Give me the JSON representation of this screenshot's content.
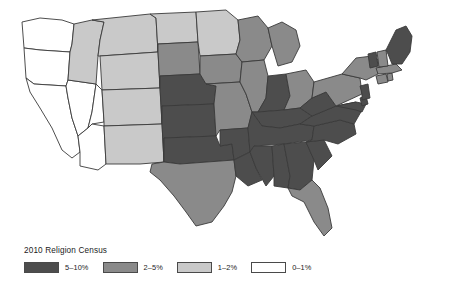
{
  "legend": {
    "title": "2010 Religion Census",
    "items": [
      {
        "label": "5–10%",
        "color": "#4d4d4d"
      },
      {
        "label": "2–5%",
        "color": "#8a8a8a"
      },
      {
        "label": "1–2%",
        "color": "#c9c9c9"
      },
      {
        "label": "0–1%",
        "color": "#ffffff"
      }
    ]
  },
  "chart_data": {
    "type": "map",
    "title": "2010 Religion Census",
    "map_region": "United States",
    "projection": "albers-usa",
    "value_unit": "percent of population",
    "classes": [
      {
        "label": "5–10%",
        "color": "#4d4d4d",
        "min": 5,
        "max": 10
      },
      {
        "label": "2–5%",
        "color": "#8a8a8a",
        "min": 2,
        "max": 5
      },
      {
        "label": "1–2%",
        "color": "#c9c9c9",
        "min": 1,
        "max": 2
      },
      {
        "label": "0–1%",
        "color": "#ffffff",
        "min": 0,
        "max": 1
      }
    ],
    "states": [
      {
        "id": "WA",
        "name": "Washington",
        "class": "0–1%",
        "color": "#ffffff"
      },
      {
        "id": "OR",
        "name": "Oregon",
        "class": "0–1%",
        "color": "#ffffff"
      },
      {
        "id": "CA",
        "name": "California",
        "class": "0–1%",
        "color": "#ffffff"
      },
      {
        "id": "NV",
        "name": "Nevada",
        "class": "0–1%",
        "color": "#ffffff"
      },
      {
        "id": "ID",
        "name": "Idaho",
        "class": "1–2%",
        "color": "#c9c9c9"
      },
      {
        "id": "MT",
        "name": "Montana",
        "class": "1–2%",
        "color": "#c9c9c9"
      },
      {
        "id": "WY",
        "name": "Wyoming",
        "class": "1–2%",
        "color": "#c9c9c9"
      },
      {
        "id": "UT",
        "name": "Utah",
        "class": "0–1%",
        "color": "#ffffff"
      },
      {
        "id": "AZ",
        "name": "Arizona",
        "class": "0–1%",
        "color": "#ffffff"
      },
      {
        "id": "CO",
        "name": "Colorado",
        "class": "1–2%",
        "color": "#c9c9c9"
      },
      {
        "id": "NM",
        "name": "New Mexico",
        "class": "1–2%",
        "color": "#c9c9c9"
      },
      {
        "id": "ND",
        "name": "North Dakota",
        "class": "1–2%",
        "color": "#c9c9c9"
      },
      {
        "id": "SD",
        "name": "South Dakota",
        "class": "2–5%",
        "color": "#8a8a8a"
      },
      {
        "id": "NE",
        "name": "Nebraska",
        "class": "5–10%",
        "color": "#4d4d4d"
      },
      {
        "id": "KS",
        "name": "Kansas",
        "class": "5–10%",
        "color": "#4d4d4d"
      },
      {
        "id": "OK",
        "name": "Oklahoma",
        "class": "5–10%",
        "color": "#4d4d4d"
      },
      {
        "id": "TX",
        "name": "Texas",
        "class": "2–5%",
        "color": "#8a8a8a"
      },
      {
        "id": "MN",
        "name": "Minnesota",
        "class": "1–2%",
        "color": "#c9c9c9"
      },
      {
        "id": "IA",
        "name": "Iowa",
        "class": "2–5%",
        "color": "#8a8a8a"
      },
      {
        "id": "MO",
        "name": "Missouri",
        "class": "2–5%",
        "color": "#8a8a8a"
      },
      {
        "id": "AR",
        "name": "Arkansas",
        "class": "5–10%",
        "color": "#4d4d4d"
      },
      {
        "id": "LA",
        "name": "Louisiana",
        "class": "5–10%",
        "color": "#4d4d4d"
      },
      {
        "id": "WI",
        "name": "Wisconsin",
        "class": "2–5%",
        "color": "#8a8a8a"
      },
      {
        "id": "IL",
        "name": "Illinois",
        "class": "2–5%",
        "color": "#8a8a8a"
      },
      {
        "id": "MI",
        "name": "Michigan",
        "class": "2–5%",
        "color": "#8a8a8a"
      },
      {
        "id": "IN",
        "name": "Indiana",
        "class": "5–10%",
        "color": "#4d4d4d"
      },
      {
        "id": "OH",
        "name": "Ohio",
        "class": "2–5%",
        "color": "#8a8a8a"
      },
      {
        "id": "KY",
        "name": "Kentucky",
        "class": "5–10%",
        "color": "#4d4d4d"
      },
      {
        "id": "TN",
        "name": "Tennessee",
        "class": "5–10%",
        "color": "#4d4d4d"
      },
      {
        "id": "MS",
        "name": "Mississippi",
        "class": "5–10%",
        "color": "#4d4d4d"
      },
      {
        "id": "AL",
        "name": "Alabama",
        "class": "5–10%",
        "color": "#4d4d4d"
      },
      {
        "id": "GA",
        "name": "Georgia",
        "class": "5–10%",
        "color": "#4d4d4d"
      },
      {
        "id": "FL",
        "name": "Florida",
        "class": "2–5%",
        "color": "#8a8a8a"
      },
      {
        "id": "SC",
        "name": "South Carolina",
        "class": "5–10%",
        "color": "#4d4d4d"
      },
      {
        "id": "NC",
        "name": "North Carolina",
        "class": "5–10%",
        "color": "#4d4d4d"
      },
      {
        "id": "VA",
        "name": "Virginia",
        "class": "5–10%",
        "color": "#4d4d4d"
      },
      {
        "id": "WV",
        "name": "West Virginia",
        "class": "5–10%",
        "color": "#4d4d4d"
      },
      {
        "id": "MD",
        "name": "Maryland",
        "class": "5–10%",
        "color": "#4d4d4d"
      },
      {
        "id": "DE",
        "name": "Delaware",
        "class": "5–10%",
        "color": "#4d4d4d"
      },
      {
        "id": "PA",
        "name": "Pennsylvania",
        "class": "2–5%",
        "color": "#8a8a8a"
      },
      {
        "id": "NJ",
        "name": "New Jersey",
        "class": "5–10%",
        "color": "#4d4d4d"
      },
      {
        "id": "NY",
        "name": "New York",
        "class": "2–5%",
        "color": "#8a8a8a"
      },
      {
        "id": "CT",
        "name": "Connecticut",
        "class": "2–5%",
        "color": "#8a8a8a"
      },
      {
        "id": "RI",
        "name": "Rhode Island",
        "class": "2–5%",
        "color": "#8a8a8a"
      },
      {
        "id": "MA",
        "name": "Massachusetts",
        "class": "2–5%",
        "color": "#8a8a8a"
      },
      {
        "id": "VT",
        "name": "Vermont",
        "class": "5–10%",
        "color": "#4d4d4d"
      },
      {
        "id": "NH",
        "name": "New Hampshire",
        "class": "2–5%",
        "color": "#8a8a8a"
      },
      {
        "id": "ME",
        "name": "Maine",
        "class": "5–10%",
        "color": "#4d4d4d"
      }
    ]
  }
}
